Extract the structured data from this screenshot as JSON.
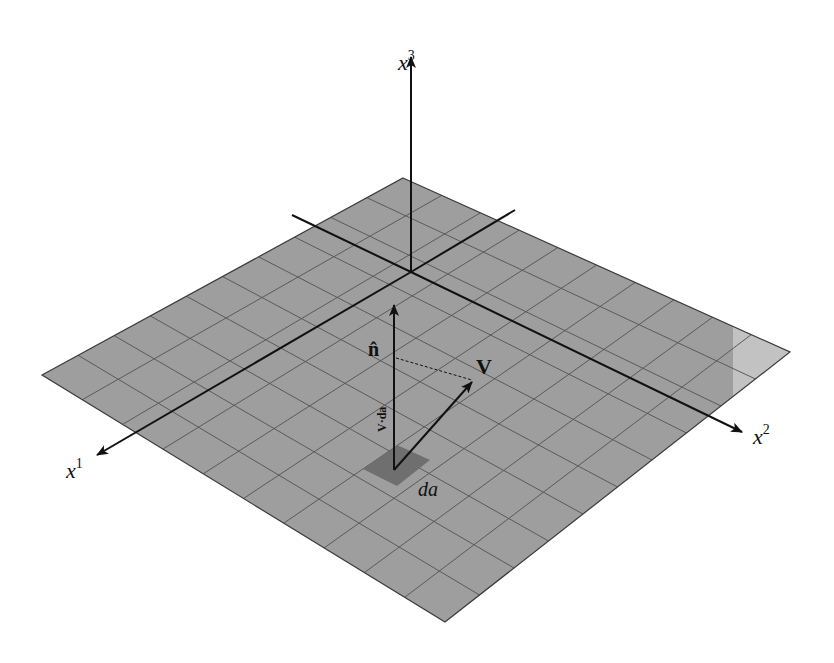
{
  "figure": {
    "colors": {
      "background": "#ffffff",
      "plane_fill": "#9e9e9e",
      "plane_light_patch": "#c2c2c2",
      "grid_line": "#5a5a5a",
      "da_patch": "#6f6f6f",
      "axis_line": "#111111"
    },
    "plane": {
      "corners": {
        "top": [
          403,
          178
        ],
        "right": [
          790,
          352
        ],
        "bottom": [
          445,
          622
        ],
        "left": [
          42,
          375
        ]
      },
      "grid_divisions": 10
    },
    "axes": {
      "origin": [
        411,
        272
      ],
      "x1": {
        "label": "x",
        "superscript": "1"
      },
      "x2": {
        "label": "x",
        "superscript": "2"
      },
      "x3": {
        "label": "x",
        "superscript": "3"
      }
    },
    "vectors": {
      "normal": {
        "label": "n̂"
      },
      "field": {
        "label": "V"
      },
      "projection": {
        "label": "V·da"
      }
    },
    "surface_element": {
      "label": "da"
    }
  }
}
